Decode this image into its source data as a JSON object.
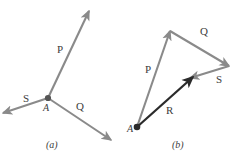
{
  "figure": {
    "width": 236,
    "height": 156,
    "background_color": "#ffffff",
    "vector_color": "#8a8a8a",
    "resultant_color": "#2b2b2b",
    "dot_color": "#555555",
    "text_color": "#3c3c3c",
    "panels": [
      {
        "id": "panel-a",
        "caption": "(a)",
        "caption_x": 46,
        "caption_y": 140,
        "origin": {
          "label": "A",
          "x": 48,
          "y": 98,
          "label_x": 43,
          "label_y": 103
        },
        "vectors": [
          {
            "name": "P",
            "label": "P",
            "label_x": 57,
            "label_y": 44,
            "from_x": 48,
            "from_y": 98,
            "to_x": 89,
            "to_y": 11,
            "color": "#8a8a8a",
            "style": "component"
          },
          {
            "name": "Q",
            "label": "Q",
            "label_x": 76,
            "label_y": 101,
            "from_x": 48,
            "from_y": 98,
            "to_x": 111,
            "to_y": 140,
            "color": "#8a8a8a",
            "style": "component"
          },
          {
            "name": "S",
            "label": "S",
            "label_x": 23,
            "label_y": 93,
            "from_x": 48,
            "from_y": 98,
            "to_x": 3,
            "to_y": 113,
            "color": "#8a8a8a",
            "style": "component"
          }
        ]
      },
      {
        "id": "panel-b",
        "caption": "(b)",
        "caption_x": 172,
        "caption_y": 140,
        "origin": {
          "label": "A",
          "x": 137,
          "y": 127,
          "label_x": 127,
          "label_y": 124
        },
        "vectors": [
          {
            "name": "P",
            "label": "P",
            "label_x": 145,
            "label_y": 64,
            "from_x": 137,
            "from_y": 127,
            "to_x": 170,
            "to_y": 31,
            "color": "#8a8a8a",
            "style": "component"
          },
          {
            "name": "Q",
            "label": "Q",
            "label_x": 200,
            "label_y": 26,
            "from_x": 170,
            "from_y": 31,
            "to_x": 229,
            "to_y": 66,
            "color": "#8a8a8a",
            "style": "component"
          },
          {
            "name": "S",
            "label": "S",
            "label_x": 216,
            "label_y": 74,
            "from_x": 229,
            "from_y": 66,
            "to_x": 190,
            "to_y": 78,
            "color": "#8a8a8a",
            "style": "component"
          },
          {
            "name": "R",
            "label": "R",
            "label_x": 166,
            "label_y": 105,
            "from_x": 137,
            "from_y": 127,
            "to_x": 193,
            "to_y": 77,
            "color": "#2b2b2b",
            "style": "resultant"
          }
        ]
      }
    ]
  }
}
